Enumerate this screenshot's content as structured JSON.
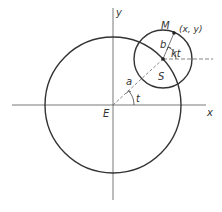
{
  "diagram": {
    "labels": {
      "y_axis": "y",
      "x_axis": "x",
      "origin": "E",
      "center_small": "S",
      "point": "M",
      "point_coords": "(x, y)",
      "radius_large": "a",
      "radius_small": "b",
      "angle_large": "t",
      "angle_small": "kt"
    },
    "colors": {
      "stroke": "#333333",
      "dashed": "#555555",
      "background": "#ffffff"
    }
  }
}
